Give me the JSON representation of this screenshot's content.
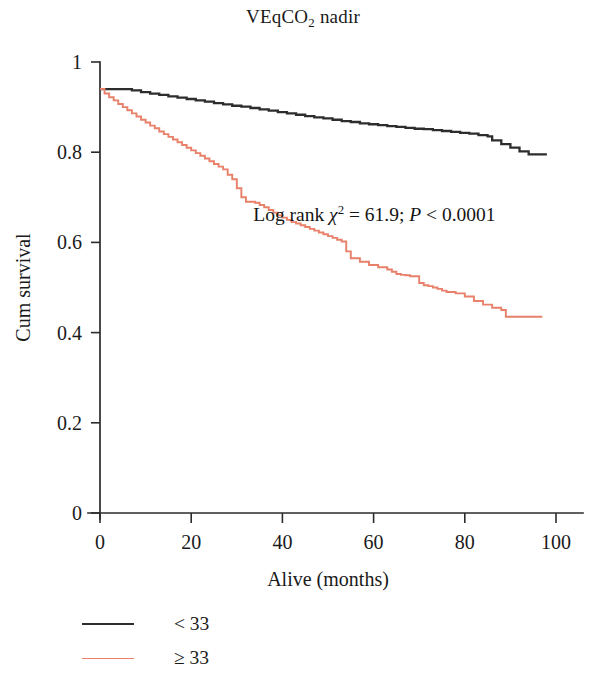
{
  "chart_data": {
    "type": "line",
    "title": "VEqCO2 nadir",
    "title_parts": {
      "pre": "VEqCO",
      "sub": "2",
      "post": " nadir"
    },
    "xlabel": "Alive (months)",
    "ylabel": "Cum survival",
    "xlim": [
      -3,
      102
    ],
    "ylim": [
      0,
      1
    ],
    "xticks": [
      0,
      20,
      40,
      60,
      80,
      100
    ],
    "xtick_labels": [
      "0",
      "20",
      "40",
      "60",
      "80",
      "100"
    ],
    "yticks": [
      0,
      0.2,
      0.4,
      0.6,
      0.8,
      1
    ],
    "ytick_labels": [
      "0",
      "0.2",
      "0.4",
      "0.6",
      "0.8",
      "1"
    ],
    "grid": false,
    "legend_position": "below-left",
    "step_style": "post",
    "annotations": [
      {
        "name": "log-rank-statistic",
        "text": "Log rank χ² = 61.9; P < 0.0001",
        "parts": {
          "lead": "Log rank ",
          "chi": "χ",
          "chi_exp": "2",
          "mid": " = 61.9; ",
          "p": "P",
          "tail": " < 0.0001"
        },
        "x": 38,
        "y": 0.655
      }
    ],
    "series": [
      {
        "name": "< 33",
        "color": "#2d2d2d",
        "linewidth": 2.3,
        "x": [
          0,
          3,
          7,
          9,
          11,
          13,
          15,
          17,
          19,
          21,
          23,
          25,
          27,
          29,
          31,
          33,
          35,
          37,
          39,
          41,
          43,
          45,
          47,
          49,
          51,
          53,
          55,
          57,
          59,
          61,
          63,
          65,
          67,
          69,
          71,
          73,
          75,
          77,
          79,
          81,
          83,
          85,
          86,
          88,
          90,
          92,
          94,
          98
        ],
        "y": [
          0.94,
          0.94,
          0.937,
          0.933,
          0.93,
          0.927,
          0.924,
          0.921,
          0.918,
          0.915,
          0.912,
          0.909,
          0.906,
          0.903,
          0.901,
          0.898,
          0.895,
          0.892,
          0.889,
          0.886,
          0.883,
          0.88,
          0.877,
          0.875,
          0.872,
          0.869,
          0.867,
          0.864,
          0.862,
          0.86,
          0.858,
          0.856,
          0.854,
          0.852,
          0.851,
          0.849,
          0.847,
          0.845,
          0.843,
          0.841,
          0.838,
          0.835,
          0.826,
          0.818,
          0.81,
          0.802,
          0.795,
          0.795
        ]
      },
      {
        "name": "≥ 33",
        "color": "#e8806a",
        "linewidth": 1.9,
        "x": [
          0,
          1,
          2,
          3,
          4,
          5,
          6,
          7,
          8,
          9,
          10,
          11,
          12,
          13,
          14,
          15,
          16,
          17,
          18,
          19,
          20,
          21,
          22,
          23,
          24,
          25,
          26,
          27,
          28,
          29,
          30,
          31,
          32,
          34,
          35,
          36,
          37,
          38,
          39,
          40,
          41,
          42,
          43,
          44,
          45,
          46,
          47,
          48,
          49,
          50,
          51,
          52,
          53,
          54,
          55,
          57,
          59,
          61,
          63,
          64,
          65,
          66,
          67,
          68,
          70,
          71,
          72,
          73,
          74,
          75,
          76,
          78,
          80,
          82,
          84,
          86,
          88,
          89,
          97
        ],
        "y": [
          0.94,
          0.93,
          0.922,
          0.915,
          0.907,
          0.9,
          0.893,
          0.886,
          0.879,
          0.872,
          0.866,
          0.859,
          0.853,
          0.846,
          0.84,
          0.834,
          0.828,
          0.822,
          0.816,
          0.81,
          0.804,
          0.798,
          0.792,
          0.786,
          0.78,
          0.774,
          0.768,
          0.762,
          0.75,
          0.74,
          0.72,
          0.7,
          0.69,
          0.688,
          0.683,
          0.678,
          0.672,
          0.666,
          0.66,
          0.655,
          0.65,
          0.645,
          0.642,
          0.638,
          0.634,
          0.63,
          0.626,
          0.622,
          0.618,
          0.614,
          0.61,
          0.606,
          0.602,
          0.58,
          0.565,
          0.557,
          0.55,
          0.545,
          0.54,
          0.535,
          0.53,
          0.528,
          0.527,
          0.525,
          0.51,
          0.505,
          0.503,
          0.5,
          0.497,
          0.493,
          0.49,
          0.487,
          0.48,
          0.47,
          0.462,
          0.455,
          0.45,
          0.435,
          0.435
        ]
      }
    ],
    "legend": [
      {
        "label": "< 33",
        "color": "#2d2d2d",
        "linewidth": 2.3
      },
      {
        "label": "≥ 33",
        "color": "#e8806a",
        "linewidth": 1.9
      }
    ]
  }
}
